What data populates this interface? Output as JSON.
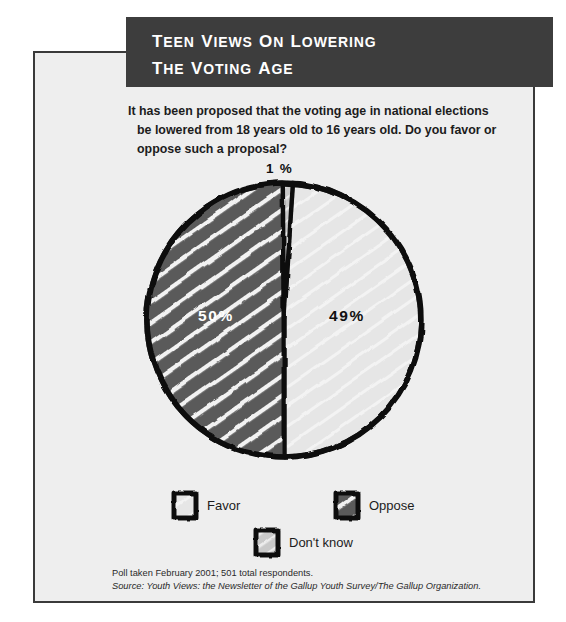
{
  "banner": {
    "line1": "Teen Views on Lowering",
    "line2": "the Voting Age",
    "bg_color": "#3d3d3d",
    "text_color": "#ffffff"
  },
  "question": {
    "line1": "It has been proposed that the voting age in national elections",
    "line2": "be lowered from 18 years old to 16 years old. Do you favor or",
    "line3": "oppose such a proposal?"
  },
  "chart_data": {
    "type": "pie",
    "title": "Teen Views on Lowering the Voting Age",
    "subtitle": "It has been proposed that the voting age in national elections be lowered from 18 years old to 16 years old. Do you favor or oppose such a proposal?",
    "categories": [
      "Oppose",
      "Favor",
      "Don't know"
    ],
    "values": [
      50,
      49,
      1
    ],
    "data_labels": [
      "50%",
      "49%",
      "1 %"
    ],
    "units": "percent",
    "colors": [
      "#5a5a5a",
      "#e3e3e3",
      "#c9c9c9"
    ],
    "legend_position": "bottom",
    "grid": false,
    "annotations": [
      "Poll taken February 2001; 501 total respondents."
    ],
    "slices": [
      {
        "name": "Oppose",
        "value": 50,
        "label": "50%",
        "color": "#5a5a5a",
        "hatched": true,
        "label_color": "#ffffff"
      },
      {
        "name": "Favor",
        "value": 49,
        "label": "49%",
        "color": "#e3e3e3",
        "hatched": false,
        "label_color": "#111111"
      },
      {
        "name": "Don't know",
        "value": 1,
        "label": "1 %",
        "color": "#c9c9c9",
        "hatched": false,
        "label_color": "#111111"
      }
    ]
  },
  "labels": {
    "oppose_pct": "50%",
    "favor_pct": "49%",
    "dontknow_pct": "1 %"
  },
  "legend": {
    "favor": "Favor",
    "oppose": "Oppose",
    "dontknow": "Don't know"
  },
  "footnote": {
    "line1": "Poll taken February 2001; 501 total respondents.",
    "line2_prefix": "Source: Youth Views: the Newsletter of the Gallup Youth Survey/The Gallup Organization."
  },
  "theme": {
    "panel_bg": "#eeeeee",
    "panel_border": "#3a3a3a",
    "ink": "#111111"
  }
}
